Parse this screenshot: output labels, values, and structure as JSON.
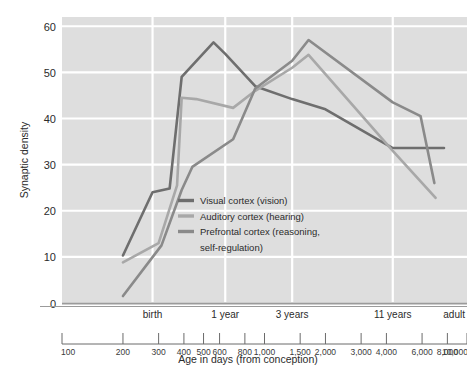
{
  "chart_data": {
    "type": "line",
    "title": "",
    "xlabel": "Age in days (from conception)",
    "ylabel": "Synaptic density",
    "xscale": "log",
    "xlim": [
      100,
      10000
    ],
    "ylim": [
      0,
      62
    ],
    "grid": true,
    "legend_position": "center-left-inside",
    "y_ticks": [
      "0",
      "10",
      "20",
      "30",
      "40",
      "50",
      "60"
    ],
    "y_tick_values": [
      0,
      10,
      20,
      30,
      40,
      50,
      60
    ],
    "x_tick_labels": [
      "100",
      "200",
      "300",
      "400",
      "500",
      "600",
      "800",
      "1,000",
      "1,500",
      "2,000",
      "3,000",
      "4,000",
      "6,000",
      "8,000",
      "10,000"
    ],
    "x_tick_values": [
      100,
      200,
      300,
      400,
      500,
      600,
      800,
      1000,
      1500,
      2000,
      3000,
      4000,
      6000,
      8000,
      10000
    ],
    "category_labels": [
      "birth",
      "1 year",
      "3 years",
      "11 years",
      "adult"
    ],
    "category_values": [
      280,
      640,
      1370,
      4300,
      9500
    ],
    "gridline_x_values": [
      280,
      640,
      1370,
      4300
    ],
    "series": [
      {
        "name": "Visual cortex (vision)",
        "color": "#6e6e6e",
        "x": [
          200,
          280,
          340,
          390,
          560,
          640,
          900,
          1370,
          2000,
          4300,
          5900,
          7700
        ],
        "y": [
          10.3,
          24.0,
          24.8,
          49.0,
          56.5,
          54.0,
          47.0,
          44.2,
          42.0,
          33.6,
          33.6,
          33.6
        ]
      },
      {
        "name": "Auditory cortex (hearing)",
        "color": "#a8a8a8",
        "x": [
          200,
          300,
          370,
          390,
          460,
          700,
          900,
          1370,
          1650,
          4300,
          7000
        ],
        "y": [
          8.8,
          13.0,
          25.5,
          44.5,
          44.2,
          42.3,
          46.0,
          51.0,
          53.8,
          33.0,
          22.8
        ]
      },
      {
        "name": "Prefrontal cortex (reasoning, self-regulation)",
        "color": "#8a8a8a",
        "x": [
          200,
          310,
          390,
          440,
          700,
          900,
          1370,
          1650,
          4300,
          5900,
          6900
        ],
        "y": [
          1.5,
          12.5,
          24.5,
          29.5,
          35.5,
          46.5,
          52.5,
          57.0,
          43.5,
          40.5,
          26.0
        ]
      }
    ]
  },
  "legend": {
    "items": [
      {
        "label": "Visual cortex (vision)",
        "color": "#6e6e6e"
      },
      {
        "label": "Auditory cortex (hearing)",
        "color": "#a8a8a8"
      },
      {
        "label": "Prefrontal cortex (reasoning,",
        "color": "#8a8a8a"
      },
      {
        "label": "self-regulation)",
        "color": ""
      }
    ]
  },
  "axes": {
    "y_title": "Synaptic density",
    "x_title": "Age in days (from conception)"
  },
  "colors": {
    "plot_background": "#dedede",
    "gridline": "#ffffff",
    "axis_line": "#9b9b9b",
    "text": "#231f20"
  }
}
